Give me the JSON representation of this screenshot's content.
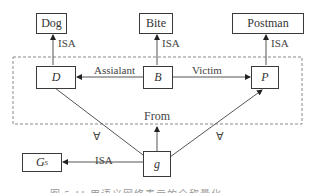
{
  "diagram": {
    "type": "semantic-network",
    "nodes": {
      "dog": "Dog",
      "bite": "Bite",
      "postman": "Postman",
      "d": "D",
      "b": "B",
      "p": "P",
      "g": "g",
      "gs_main": "G",
      "gs_sub": "S"
    },
    "edges": {
      "d_dog": "ISA",
      "b_bite": "ISA",
      "p_postman": "ISA",
      "b_d": "Assialant",
      "b_p": "Victim",
      "g_from": "From",
      "g_gs": "ISA",
      "forall_left": "∀",
      "forall_right": "∀"
    },
    "caption": "图 5-11  用语义网络表示的全称量化"
  }
}
